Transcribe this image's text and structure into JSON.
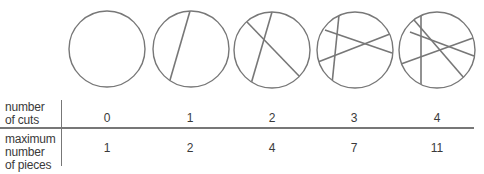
{
  "colors": {
    "stroke": "#777777",
    "text": "#3a3a3a",
    "background": "#ffffff"
  },
  "table": {
    "row_labels": {
      "cuts": [
        "number",
        "of cuts"
      ],
      "pieces": [
        "maximum",
        "number",
        "of pieces"
      ]
    },
    "columns": [
      {
        "cuts": "0",
        "pieces": "1"
      },
      {
        "cuts": "1",
        "pieces": "2"
      },
      {
        "cuts": "2",
        "pieces": "4"
      },
      {
        "cuts": "3",
        "pieces": "7"
      },
      {
        "cuts": "4",
        "pieces": "11"
      }
    ]
  },
  "circles": [
    {
      "cx": 107,
      "cy": 49,
      "r": 38,
      "cuts": []
    },
    {
      "cx": 191,
      "cy": 49,
      "r": 38,
      "cuts": [
        [
          190,
          11,
          168,
          87
        ]
      ]
    },
    {
      "cx": 272,
      "cy": 50,
      "r": 38,
      "cuts": [
        [
          272,
          12,
          251,
          84
        ],
        [
          247,
          22,
          300,
          77
        ]
      ]
    },
    {
      "cx": 355,
      "cy": 50,
      "r": 38,
      "cuts": [
        [
          339,
          15,
          332,
          84
        ],
        [
          325,
          30,
          392,
          53
        ],
        [
          318,
          62,
          390,
          34
        ]
      ]
    },
    {
      "cx": 437,
      "cy": 50,
      "r": 38,
      "cuts": [
        [
          421,
          14,
          421,
          87
        ],
        [
          410,
          32,
          474,
          56
        ],
        [
          401,
          64,
          473,
          38
        ],
        [
          414,
          20,
          464,
          78
        ]
      ]
    }
  ]
}
